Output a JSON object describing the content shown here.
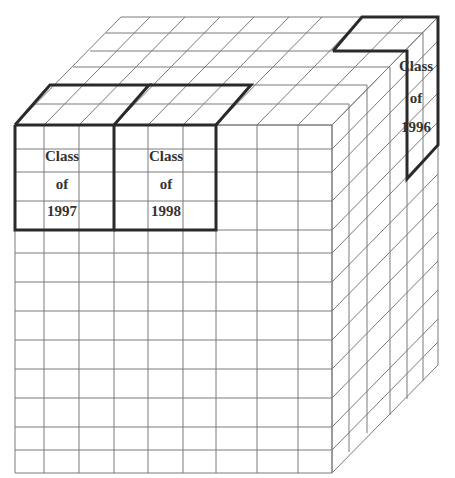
{
  "diagram": {
    "colors": {
      "grid": "#7a7a7a",
      "highlight": "#2a2a2a",
      "text": "#333333",
      "background": "#ffffff"
    },
    "cube": {
      "front_origin": [
        15,
        125
      ],
      "front_columns_x": [
        15,
        44,
        79,
        114,
        148,
        183,
        216,
        257,
        298,
        332
      ],
      "front_rows_y": [
        125,
        149,
        172,
        201,
        230,
        253,
        282,
        311,
        340,
        369,
        398,
        427,
        450,
        473
      ],
      "depth_offsets": [
        [
          0,
          0
        ],
        [
          17,
          -21
        ],
        [
          35,
          -40
        ],
        [
          58,
          -58
        ],
        [
          75,
          -74
        ],
        [
          91,
          -92
        ],
        [
          106,
          -108
        ]
      ]
    },
    "slices": [
      {
        "id": "class-1997",
        "lines": [
          "Class",
          "of",
          "1997"
        ],
        "label_x": 62,
        "label_y": [
          161,
          189,
          216
        ]
      },
      {
        "id": "class-1998",
        "lines": [
          "Class",
          "of",
          "1998"
        ],
        "label_x": 166,
        "label_y": [
          161,
          189,
          216
        ]
      },
      {
        "id": "class-1996",
        "lines": [
          "Class",
          "of",
          "1996"
        ],
        "label_x": 416,
        "label_y": [
          71,
          103,
          132
        ]
      }
    ]
  }
}
